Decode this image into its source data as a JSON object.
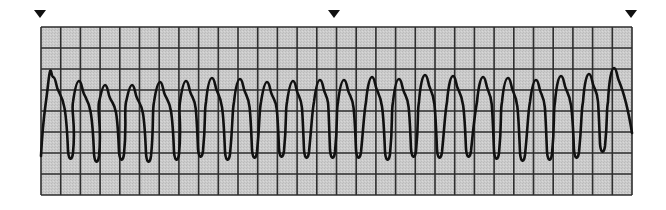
{
  "diagram": {
    "type": "ecg-rhythm-strip",
    "colors": {
      "background": "#ffffff",
      "paper": "#c9c9c9",
      "grid_line": "#2e2e2e",
      "trace": "#111111",
      "marker": "#111111"
    },
    "grid": {
      "left": 41,
      "top": 27,
      "right": 632,
      "bottom": 195,
      "columns": 30,
      "rows": 8
    },
    "markers": [
      {
        "x": 40,
        "y": 10
      },
      {
        "x": 334,
        "y": 10
      },
      {
        "x": 631,
        "y": 10
      }
    ],
    "trace": {
      "start": {
        "x": 41,
        "y": 156
      },
      "end": {
        "x": 632,
        "y": 133
      },
      "beats": [
        {
          "peak_x": 53,
          "peak_y": 77,
          "trough_x": 71,
          "trough_y": 159
        },
        {
          "peak_x": 79,
          "peak_y": 81,
          "trough_x": 97,
          "trough_y": 162
        },
        {
          "peak_x": 105,
          "peak_y": 85,
          "trough_x": 122,
          "trough_y": 160
        },
        {
          "peak_x": 132,
          "peak_y": 85,
          "trough_x": 149,
          "trough_y": 162
        },
        {
          "peak_x": 160,
          "peak_y": 82,
          "trough_x": 177,
          "trough_y": 160
        },
        {
          "peak_x": 186,
          "peak_y": 81,
          "trough_x": 201,
          "trough_y": 157
        },
        {
          "peak_x": 212,
          "peak_y": 78,
          "trough_x": 228,
          "trough_y": 160
        },
        {
          "peak_x": 240,
          "peak_y": 79,
          "trough_x": 255,
          "trough_y": 158
        },
        {
          "peak_x": 267,
          "peak_y": 82,
          "trough_x": 282,
          "trough_y": 157
        },
        {
          "peak_x": 293,
          "peak_y": 81,
          "trough_x": 307,
          "trough_y": 158
        },
        {
          "peak_x": 320,
          "peak_y": 80,
          "trough_x": 333,
          "trough_y": 158
        },
        {
          "peak_x": 344,
          "peak_y": 80,
          "trough_x": 359,
          "trough_y": 158
        },
        {
          "peak_x": 372,
          "peak_y": 77,
          "trough_x": 388,
          "trough_y": 160
        },
        {
          "peak_x": 399,
          "peak_y": 79,
          "trough_x": 414,
          "trough_y": 157
        },
        {
          "peak_x": 425,
          "peak_y": 75,
          "trough_x": 440,
          "trough_y": 158
        },
        {
          "peak_x": 453,
          "peak_y": 76,
          "trough_x": 469,
          "trough_y": 157
        },
        {
          "peak_x": 483,
          "peak_y": 77,
          "trough_x": 497,
          "trough_y": 159
        },
        {
          "peak_x": 508,
          "peak_y": 78,
          "trough_x": 523,
          "trough_y": 161
        },
        {
          "peak_x": 536,
          "peak_y": 80,
          "trough_x": 550,
          "trough_y": 160
        },
        {
          "peak_x": 561,
          "peak_y": 76,
          "trough_x": 577,
          "trough_y": 158
        },
        {
          "peak_x": 589,
          "peak_y": 74,
          "trough_x": 603,
          "trough_y": 152
        },
        {
          "peak_x": 614,
          "peak_y": 68,
          "trough_x": null,
          "trough_y": null
        }
      ]
    }
  }
}
